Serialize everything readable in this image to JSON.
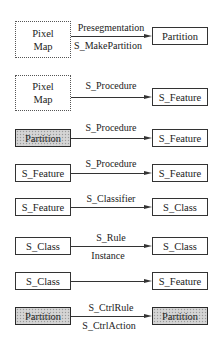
{
  "diagram": {
    "rows": [
      {
        "source": {
          "label_line1": "Pixel",
          "label_line2": "Map",
          "style": "dotted"
        },
        "edge": {
          "label_above": "Presegmentation",
          "label_below": "S_MakePartition"
        },
        "target": {
          "label": "Partition",
          "style": "plain"
        }
      },
      {
        "source": {
          "label_line1": "Pixel",
          "label_line2": "Map",
          "style": "dotted"
        },
        "edge": {
          "label_above": "S_Procedure",
          "label_below": ""
        },
        "target": {
          "label": "S_Feature",
          "style": "plain"
        }
      },
      {
        "source": {
          "label": "Partition",
          "style": "shaded"
        },
        "edge": {
          "label_above": "S_Procedure",
          "label_below": ""
        },
        "target": {
          "label": "S_Feature",
          "style": "plain"
        }
      },
      {
        "source": {
          "label": "S_Feature",
          "style": "plain"
        },
        "edge": {
          "label_above": "S_Procedure",
          "label_below": ""
        },
        "target": {
          "label": "S_Feature",
          "style": "plain"
        }
      },
      {
        "source": {
          "label": "S_Feature",
          "style": "plain"
        },
        "edge": {
          "label_above": "S_Classifier",
          "label_below": ""
        },
        "target": {
          "label": "S_Class",
          "style": "plain"
        }
      },
      {
        "source": {
          "label": "S_Class",
          "style": "plain"
        },
        "edge": {
          "label_above": "S_Rule",
          "label_below": "Instance"
        },
        "target": {
          "label": "S_Class",
          "style": "plain"
        }
      },
      {
        "source": {
          "label": "S_Class",
          "style": "plain"
        },
        "edge": {
          "label_above": "",
          "label_below": ""
        },
        "target": {
          "label": "S_Feature",
          "style": "plain"
        }
      },
      {
        "source": {
          "label": "Partition",
          "style": "shaded"
        },
        "edge": {
          "label_above": "S_CtrlRule",
          "label_below": "S_CtrlAction"
        },
        "target": {
          "label": "Partition",
          "style": "shaded"
        }
      }
    ]
  }
}
